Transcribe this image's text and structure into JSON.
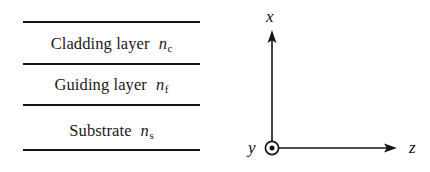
{
  "figure": {
    "type": "planar-slab-waveguide-cross-section",
    "background_color": "#ffffff",
    "line_color": "#141414",
    "text_color": "#1a1a1a"
  },
  "layer_stack": {
    "rule_count": 4,
    "layers": [
      {
        "name": "Cladding layer",
        "symbol": "n",
        "subscript": "c"
      },
      {
        "name": "Guiding layer",
        "symbol": "n",
        "subscript": "f"
      },
      {
        "name": "Substrate",
        "symbol": "n",
        "subscript": "s"
      }
    ]
  },
  "axes": {
    "origin_marker": "circle-dot",
    "x_axis": {
      "label": "x",
      "direction": "up",
      "arrowhead": true
    },
    "y_axis": {
      "label": "y",
      "direction": "out-of-page",
      "arrowhead": false
    },
    "z_axis": {
      "label": "z",
      "direction": "right",
      "arrowhead": true
    }
  }
}
